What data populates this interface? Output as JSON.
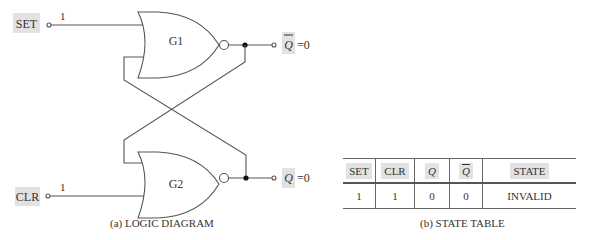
{
  "diagram": {
    "inputs": {
      "set": {
        "label": "SET",
        "value": "1"
      },
      "clr": {
        "label": "CLR",
        "value": "1"
      }
    },
    "gates": [
      {
        "id": "G1",
        "label": "G1",
        "type": "NOR"
      },
      {
        "id": "G2",
        "label": "G2",
        "type": "NOR"
      }
    ],
    "outputs": {
      "q_bar": {
        "symbol": "Q",
        "overline": true,
        "equals": "=0"
      },
      "q": {
        "symbol": "Q",
        "overline": false,
        "equals": "=0"
      }
    },
    "caption": "(a)  LOGIC DIAGRAM"
  },
  "state_table": {
    "headers": [
      "SET",
      "CLR",
      "Q",
      "Q"
    ],
    "state_header": "STATE",
    "rows": [
      {
        "set": "1",
        "clr": "1",
        "q": "0",
        "q_bar": "0",
        "state": "INVALID"
      }
    ],
    "caption": "(b)  STATE TABLE"
  },
  "colors": {
    "line": "#555555",
    "label_highlight": "#e2e2e2",
    "text": "#333333"
  }
}
